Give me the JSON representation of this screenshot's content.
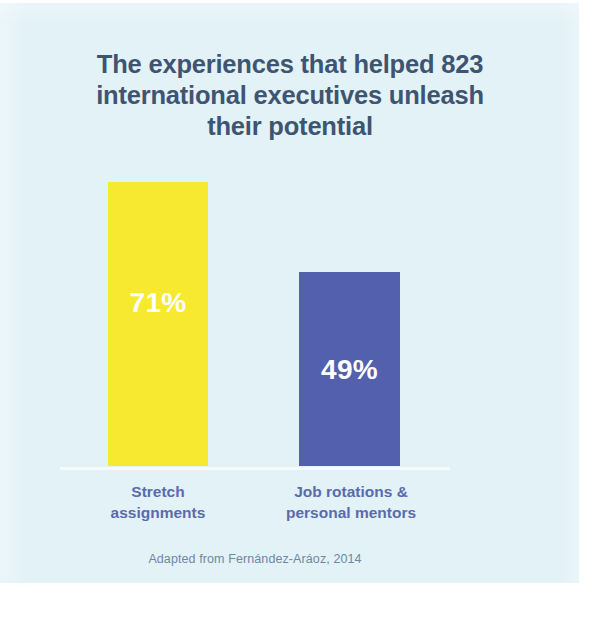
{
  "figure": {
    "title_lines": [
      "The experiences that helped 823",
      "international executives unleash",
      "their potential"
    ],
    "source_note": "Adapted from Fernández-Aráoz, 2014",
    "colors": {
      "background": "#e3f2f7",
      "title_text": "#3e5572",
      "category_text": "#5a6aae",
      "source_text": "#6d87a3",
      "baseline": "#f4fbfd",
      "bar_stretch": "#f6e92f",
      "bar_rotations": "#5260ad",
      "value_text": "#ffffff"
    }
  },
  "chart_data": {
    "type": "bar",
    "title": "The experiences that helped 823 international executives unleash their potential",
    "categories": [
      "Stretch assignments",
      "Job rotations & personal mentors"
    ],
    "category_lines": [
      [
        "Stretch",
        "assignments"
      ],
      [
        "Job rotations &",
        "personal mentors"
      ]
    ],
    "values": [
      71,
      49
    ],
    "value_labels": [
      "71%",
      "49%"
    ],
    "bar_colors": [
      "#f6e92f",
      "#5260ad"
    ],
    "unit": "%",
    "xlabel": "",
    "ylabel": "",
    "ylim": [
      0,
      100
    ],
    "grid": false,
    "legend": "none",
    "axis_ticks_visible": false,
    "annotations": [
      "Adapted from Fernández-Aráoz, 2014"
    ]
  }
}
